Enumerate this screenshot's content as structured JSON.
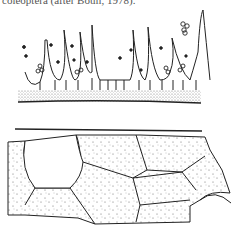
{
  "figure": {
    "caption_fragment": "coleoptera (after Bouli, 1978).",
    "panels": [
      {
        "name": "upper-panel",
        "description": "cross-section with row of hair-like setae with attached spores over stippled layer"
      },
      {
        "name": "lower-panel",
        "description": "surface view of polygonal stippled cells beneath a horizontal line"
      }
    ],
    "colors": {
      "ink": "#222222",
      "paper": "#ffffff",
      "stipple": "#555555"
    }
  }
}
